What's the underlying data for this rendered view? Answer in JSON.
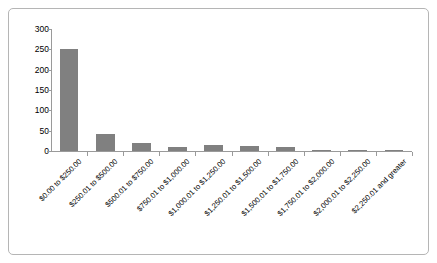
{
  "chart_data": {
    "type": "bar",
    "title": "",
    "subtitle": "",
    "xlabel": "",
    "ylabel": "",
    "categories": [
      "$0.00 to $250.00",
      "$250.01 to $500.00",
      "$500.01 to $750.00",
      "$750.01 to $1,000.00",
      "$1,000.01 to $1,250.00",
      "$1,250.01 to $1,500.00",
      "$1,500.01 to $1,750.00",
      "$1,750.01 to $2,000.00",
      "$2,000.01 to $2,250.00",
      "$2,250.01 and greater"
    ],
    "values": [
      252,
      41,
      19,
      11,
      15,
      12,
      11,
      3,
      2,
      1
    ],
    "ylim": [
      0,
      300
    ],
    "yticks": [
      0,
      50,
      100,
      150,
      200,
      250,
      300
    ],
    "ytick_labels": [
      "0",
      "50",
      "100",
      "150",
      "200",
      "250",
      "300"
    ],
    "grid": false,
    "legend": false,
    "legend_position": "none",
    "bar_color": "#808080",
    "axis_color": "#9a9a9a",
    "frame_color": "#b5b5b5",
    "background_color": "#ffffff"
  }
}
